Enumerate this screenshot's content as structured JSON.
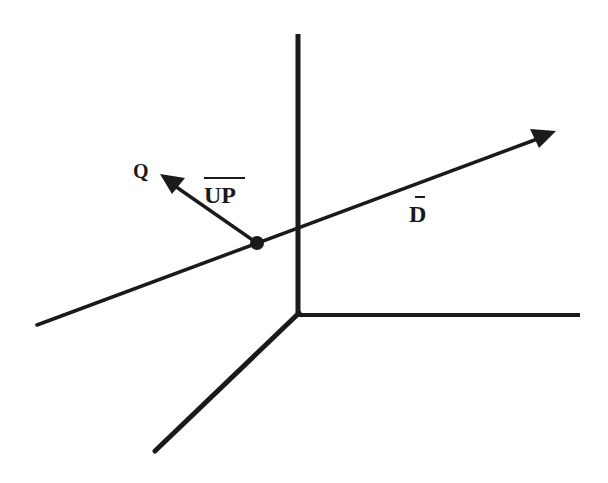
{
  "diagram": {
    "type": "3d-coordinate-vectors",
    "labels": {
      "point_q": "Q",
      "up_vector": "UP",
      "direction_vector": "D"
    },
    "colors": {
      "ink": "#1a1a1a",
      "background": "#ffffff"
    },
    "axes": [
      {
        "name": "vertical-axis",
        "from": [
          298,
          34
        ],
        "to": [
          298,
          314
        ]
      },
      {
        "name": "horizontal-axis",
        "from": [
          298,
          315
        ],
        "to": [
          580,
          315
        ]
      },
      {
        "name": "depth-axis",
        "from": [
          298,
          314
        ],
        "to": [
          155,
          451
        ]
      }
    ],
    "vectors": [
      {
        "name": "direction-vector-D",
        "from": [
          37,
          325
        ],
        "to": [
          556,
          132
        ]
      },
      {
        "name": "up-vector",
        "from": [
          257,
          243
        ],
        "to": [
          160,
          175
        ]
      }
    ],
    "point": {
      "name": "origin-point-P",
      "at": [
        257,
        243
      ]
    }
  }
}
